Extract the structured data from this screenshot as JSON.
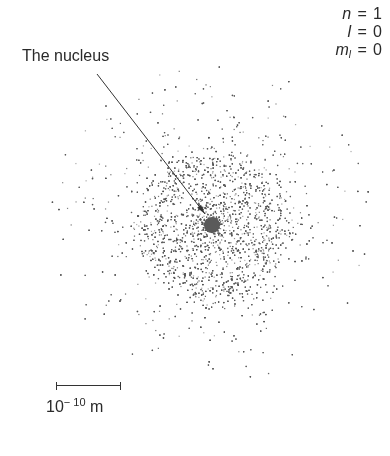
{
  "diagram": {
    "nucleus_label": "The nucleus",
    "quantum_numbers": [
      {
        "symbol": "n",
        "subscript": "",
        "value": "1"
      },
      {
        "symbol": "l",
        "subscript": "",
        "value": "0"
      },
      {
        "symbol": "m",
        "subscript": "l",
        "value": "0"
      }
    ],
    "scale_bar": {
      "base": "10",
      "exponent": "− 10",
      "unit": " m"
    },
    "cloud": {
      "center": [
        212,
        225
      ],
      "nucleus_radius": 8,
      "nucleus_color": "#5a5a5a",
      "ring_peak_radius": 62,
      "ring_width": 12,
      "outer_radius": 165,
      "dot_color": "#555555",
      "arrow_from": [
        97,
        74
      ],
      "arrow_to": [
        205,
        214
      ]
    }
  }
}
